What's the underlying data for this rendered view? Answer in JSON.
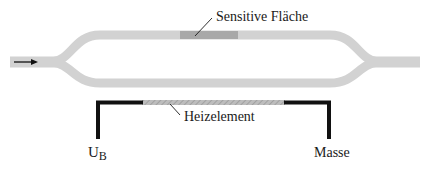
{
  "labels": {
    "sensitive_area": "Sensitive Fläche",
    "heater": "Heizelement",
    "supply_main": "U",
    "supply_sub": "B",
    "ground": "Masse"
  },
  "colors": {
    "channel": "#d2d2d2",
    "sensitive": "#a8a8a8",
    "heater": "#b4b4b4",
    "wire": "#111111",
    "text": "#1a1a1a"
  }
}
